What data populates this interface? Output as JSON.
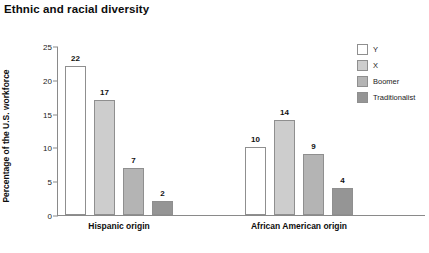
{
  "chart_data": {
    "type": "bar",
    "title": "Ethnic and racial diversity",
    "xlabel": "",
    "ylabel": "Percentage of the U.S. workforce",
    "ylim": [
      0,
      25
    ],
    "yticks": [
      0,
      5,
      10,
      15,
      20,
      25
    ],
    "ytick_labels": [
      "0",
      "5",
      "10",
      "15",
      "20",
      "25"
    ],
    "grid": false,
    "legend_position": "right",
    "categories": [
      "Hispanic origin",
      "African American origin"
    ],
    "series": [
      {
        "name": "Y",
        "color": "#ffffff",
        "values": [
          22,
          10
        ]
      },
      {
        "name": "X",
        "color": "#cdcdcd",
        "values": [
          17,
          14
        ]
      },
      {
        "name": "Boomer",
        "color": "#b4b4b4",
        "values": [
          7,
          9
        ]
      },
      {
        "name": "Traditionalist",
        "color": "#959595",
        "values": [
          2,
          4
        ]
      }
    ],
    "value_labels": [
      [
        "22",
        "17",
        "7",
        "2"
      ],
      [
        "10",
        "14",
        "9",
        "4"
      ]
    ]
  },
  "legend": {
    "items": [
      {
        "label": "Y"
      },
      {
        "label": "X"
      },
      {
        "label": "Boomer"
      },
      {
        "label": "Traditionalist"
      }
    ]
  },
  "axis": {
    "y_label": "Percentage of the U.S. workforce",
    "y_ticks": [
      "25",
      "20",
      "15",
      "10",
      "5",
      "0"
    ]
  },
  "groups": [
    {
      "label": "Hispanic origin"
    },
    {
      "label": "African American origin"
    }
  ]
}
